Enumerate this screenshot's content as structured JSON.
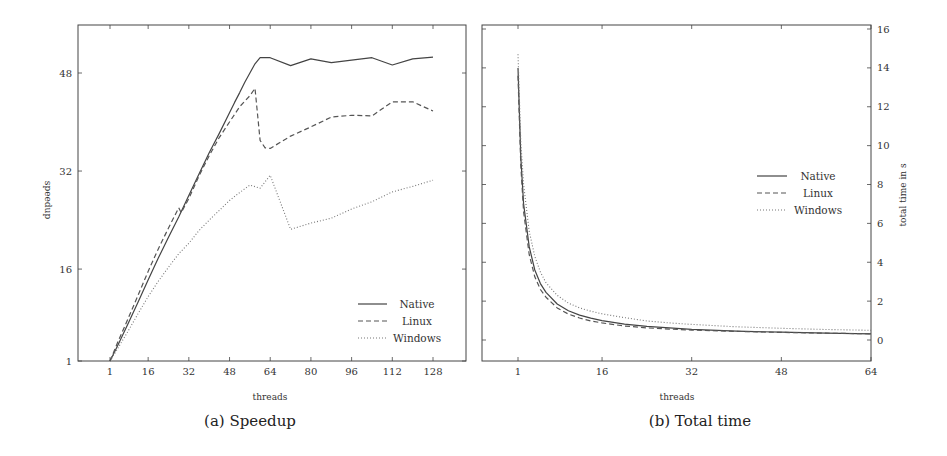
{
  "chart_data": [
    {
      "id": "speedup",
      "type": "line",
      "caption": "(a) Speedup",
      "title": "",
      "xlabel": "threads",
      "ylabel": "speedup",
      "xticks": [
        1,
        16,
        32,
        48,
        64,
        80,
        96,
        112,
        128
      ],
      "yticks": [
        1,
        16,
        32,
        48
      ],
      "xlim": [
        -11,
        142
      ],
      "ylim": [
        1,
        58
      ],
      "y_axis_side": "left",
      "grid": false,
      "legend_position": "lower right",
      "series": [
        {
          "name": "Native",
          "style": "solid",
          "points": [
            [
              1,
              1
            ],
            [
              4,
              3.5
            ],
            [
              8,
              7
            ],
            [
              12,
              10.6
            ],
            [
              16,
              14.2
            ],
            [
              20,
              17.8
            ],
            [
              24,
              21.2
            ],
            [
              28,
              24.5
            ],
            [
              32,
              28
            ],
            [
              36,
              31.5
            ],
            [
              40,
              35
            ],
            [
              44,
              38.2
            ],
            [
              48,
              41.5
            ],
            [
              50,
              43.2
            ],
            [
              52,
              44.8
            ],
            [
              54,
              46.5
            ],
            [
              56,
              48
            ],
            [
              58,
              49.5
            ],
            [
              60,
              50.5
            ],
            [
              64,
              50.5
            ],
            [
              72,
              49.2
            ],
            [
              80,
              50.3
            ],
            [
              88,
              49.7
            ],
            [
              96,
              50.1
            ],
            [
              104,
              50.5
            ],
            [
              112,
              49.3
            ],
            [
              120,
              50.3
            ],
            [
              128,
              50.6
            ]
          ]
        },
        {
          "name": "Linux",
          "style": "dashed",
          "points": [
            [
              1,
              1
            ],
            [
              4,
              4
            ],
            [
              8,
              7.8
            ],
            [
              12,
              11.7
            ],
            [
              16,
              15.6
            ],
            [
              20,
              19.3
            ],
            [
              24,
              22.7
            ],
            [
              28,
              26
            ],
            [
              29,
              25.2
            ],
            [
              32,
              27.5
            ],
            [
              36,
              31.2
            ],
            [
              40,
              34.5
            ],
            [
              44,
              37.5
            ],
            [
              48,
              40
            ],
            [
              52,
              42.5
            ],
            [
              56,
              44.3
            ],
            [
              58,
              45.5
            ],
            [
              60,
              37
            ],
            [
              62,
              35.8
            ],
            [
              64,
              35.7
            ],
            [
              72,
              37.7
            ],
            [
              80,
              39.2
            ],
            [
              88,
              40.8
            ],
            [
              96,
              41.1
            ],
            [
              104,
              41
            ],
            [
              112,
              43.3
            ],
            [
              120,
              43.3
            ],
            [
              128,
              41.8
            ]
          ]
        },
        {
          "name": "Windows",
          "style": "dotted",
          "points": [
            [
              1,
              1
            ],
            [
              4,
              3
            ],
            [
              8,
              5.8
            ],
            [
              12,
              8.7
            ],
            [
              16,
              11.5
            ],
            [
              20,
              14
            ],
            [
              24,
              16.3
            ],
            [
              28,
              18.5
            ],
            [
              32,
              20.2
            ],
            [
              36,
              22.3
            ],
            [
              40,
              24
            ],
            [
              44,
              25.6
            ],
            [
              48,
              27.2
            ],
            [
              52,
              28.5
            ],
            [
              56,
              29.7
            ],
            [
              60,
              29.2
            ],
            [
              64,
              31.3
            ],
            [
              72,
              22.5
            ],
            [
              80,
              23.5
            ],
            [
              88,
              24.3
            ],
            [
              96,
              25.8
            ],
            [
              104,
              27
            ],
            [
              112,
              28.6
            ],
            [
              120,
              29.5
            ],
            [
              128,
              30.5
            ]
          ]
        }
      ]
    },
    {
      "id": "total_time",
      "type": "line",
      "caption": "(b) Total time",
      "title": "",
      "xlabel": "threads",
      "ylabel": "total time in s",
      "xticks": [
        1,
        16,
        32,
        48,
        64
      ],
      "yticks": [
        0,
        2,
        4,
        6,
        8,
        10,
        12,
        14,
        16
      ],
      "xlim": [
        -5.4,
        64
      ],
      "ylim": [
        -1.15,
        16.2
      ],
      "y_axis_side": "right",
      "grid": false,
      "legend_position": "center right",
      "series": [
        {
          "name": "Native",
          "style": "solid",
          "points": [
            [
              1,
              14.0
            ],
            [
              1.5,
              9.4
            ],
            [
              2,
              7.0
            ],
            [
              3,
              4.8
            ],
            [
              4,
              3.6
            ],
            [
              5,
              2.9
            ],
            [
              6,
              2.45
            ],
            [
              8,
              1.85
            ],
            [
              10,
              1.5
            ],
            [
              12,
              1.28
            ],
            [
              14,
              1.12
            ],
            [
              16,
              1.0
            ],
            [
              20,
              0.82
            ],
            [
              24,
              0.7
            ],
            [
              28,
              0.62
            ],
            [
              32,
              0.55
            ],
            [
              40,
              0.46
            ],
            [
              48,
              0.4
            ],
            [
              56,
              0.35
            ],
            [
              64,
              0.32
            ]
          ]
        },
        {
          "name": "Linux",
          "style": "dashed",
          "points": [
            [
              1,
              13.6
            ],
            [
              1.5,
              9.0
            ],
            [
              2,
              6.6
            ],
            [
              3,
              4.4
            ],
            [
              4,
              3.25
            ],
            [
              5,
              2.6
            ],
            [
              6,
              2.2
            ],
            [
              8,
              1.65
            ],
            [
              10,
              1.33
            ],
            [
              12,
              1.13
            ],
            [
              14,
              0.98
            ],
            [
              16,
              0.88
            ],
            [
              20,
              0.72
            ],
            [
              24,
              0.62
            ],
            [
              28,
              0.56
            ],
            [
              32,
              0.51
            ],
            [
              40,
              0.44
            ],
            [
              48,
              0.39
            ],
            [
              56,
              0.35
            ],
            [
              64,
              0.32
            ]
          ]
        },
        {
          "name": "Windows",
          "style": "dotted",
          "points": [
            [
              1,
              14.7
            ],
            [
              1.5,
              10.2
            ],
            [
              2,
              8.0
            ],
            [
              3,
              5.6
            ],
            [
              4,
              4.3
            ],
            [
              5,
              3.5
            ],
            [
              6,
              2.95
            ],
            [
              8,
              2.3
            ],
            [
              10,
              1.9
            ],
            [
              12,
              1.65
            ],
            [
              14,
              1.48
            ],
            [
              16,
              1.35
            ],
            [
              20,
              1.15
            ],
            [
              24,
              0.98
            ],
            [
              28,
              0.88
            ],
            [
              32,
              0.8
            ],
            [
              40,
              0.68
            ],
            [
              48,
              0.6
            ],
            [
              56,
              0.54
            ],
            [
              64,
              0.5
            ]
          ]
        }
      ]
    }
  ],
  "panels": {
    "speedup": {
      "caption": "(a) Speedup",
      "xlabel": "threads",
      "ylabel": "speedup"
    },
    "total_time": {
      "caption": "(b) Total time",
      "xlabel": "threads",
      "ylabel": "total time in s"
    }
  }
}
